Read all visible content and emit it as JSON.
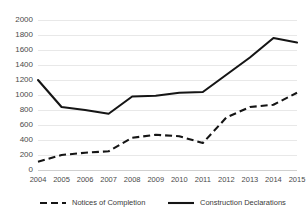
{
  "chart_data": {
    "type": "line",
    "title": "",
    "subtitle": "",
    "xlabel": "",
    "ylabel": "",
    "categories": [
      "2004",
      "2005",
      "2006",
      "2007",
      "2008",
      "2009",
      "2010",
      "2011",
      "2012",
      "2013",
      "2014",
      "2015"
    ],
    "series": [
      {
        "name": "Notices of Completion",
        "style": "dashed",
        "color": "#151515",
        "values": [
          110,
          200,
          230,
          250,
          430,
          470,
          450,
          360,
          700,
          840,
          870,
          1030
        ]
      },
      {
        "name": "Construction Declarations",
        "style": "solid",
        "color": "#151515",
        "values": [
          1200,
          840,
          800,
          750,
          980,
          990,
          1030,
          1040,
          1270,
          1500,
          1760,
          1700
        ]
      }
    ],
    "ylim": [
      0,
      2000
    ],
    "yticks": [
      "0",
      "200",
      "400",
      "600",
      "800",
      "1000",
      "1200",
      "1400",
      "1600",
      "1800",
      "2000"
    ],
    "ytick_values": [
      0,
      200,
      400,
      600,
      800,
      1000,
      1200,
      1400,
      1600,
      1800,
      2000
    ],
    "grid": true,
    "grid_axis": "y",
    "legend_position": "bottom",
    "legend": [
      "Notices of Completion",
      "Construction Declarations"
    ],
    "background": "#ffffff",
    "gridline_color": "#e8e8e8"
  }
}
